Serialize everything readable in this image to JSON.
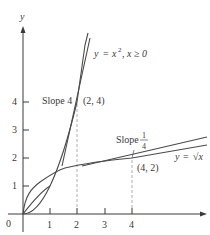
{
  "figure": {
    "axes": {
      "x_label": "x",
      "y_label": "y",
      "origin_label": "0",
      "x_ticks": [
        "1",
        "2",
        "3",
        "4"
      ],
      "y_ticks": [
        "1",
        "2",
        "3",
        "4"
      ]
    },
    "curves": [
      {
        "name": "parabola",
        "label": "y = x², x ≥ 0",
        "label_parts": {
          "lhs": "y",
          "eq": "=",
          "rhs": "x",
          "exp": "2",
          "cond": ", x ≥ 0"
        }
      },
      {
        "name": "sqrt",
        "label": "y = √x",
        "label_parts": {
          "lhs": "y",
          "eq": "=",
          "rhs": "√x"
        }
      }
    ],
    "annotations": {
      "slope4": {
        "text": "Slope 4",
        "point": "(2, 4)"
      },
      "slope_quarter": {
        "text": "Slope",
        "num": "1",
        "den": "4",
        "point": "(4, 2)"
      }
    },
    "colors": {
      "curve": "#4a4a4a",
      "axis": "#3a3a3a",
      "dashed": "#9a9a9a",
      "text": "#3a3a3a"
    }
  }
}
